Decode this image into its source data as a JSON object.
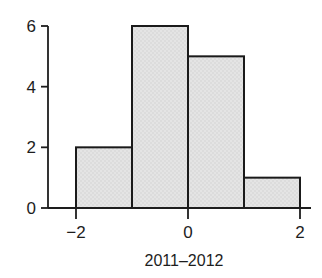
{
  "chart_data": {
    "type": "bar",
    "title": "",
    "subtitle": "",
    "xlabel": "2011–2012",
    "ylabel": "",
    "categories": [
      "[-2, -1)",
      "[-1, 0)",
      "[0, 1)",
      "[1, 2)"
    ],
    "bin_edges": [
      -2,
      -1,
      0,
      1,
      2
    ],
    "values": [
      2,
      6,
      5,
      1
    ],
    "bars": [
      {
        "label": "[-2, -1)",
        "x0": -2,
        "x1": -1,
        "value": 2
      },
      {
        "label": "[-1, 0)",
        "x0": -1,
        "x1": 0,
        "value": 6
      },
      {
        "label": "[0, 1)",
        "x0": 0,
        "x1": 1,
        "value": 5
      },
      {
        "label": "[1, 2)",
        "x0": 1,
        "x1": 2,
        "value": 1
      }
    ],
    "xlim": [
      -2,
      2
    ],
    "ylim": [
      0,
      6
    ],
    "x_ticks": [
      -2,
      0,
      2
    ],
    "x_tick_labels": [
      "−2",
      "0",
      "2"
    ],
    "y_ticks": [
      0,
      2,
      4,
      6
    ],
    "y_tick_labels": [
      "0",
      "2",
      "4",
      "6"
    ],
    "grid": false,
    "legend": null,
    "legend_position": "none",
    "annotations": [],
    "bar_fill_color": "#e3e3e3",
    "bar_edge_color": "#1a1a1a",
    "axis_color": "#1d1d1d",
    "background_color": "#ffffff"
  },
  "axes": {
    "x_tick_labels": [
      "−2",
      "0",
      "2"
    ],
    "y_tick_labels": [
      "0",
      "2",
      "4",
      "6"
    ],
    "x_axis_title": "2011–2012"
  }
}
